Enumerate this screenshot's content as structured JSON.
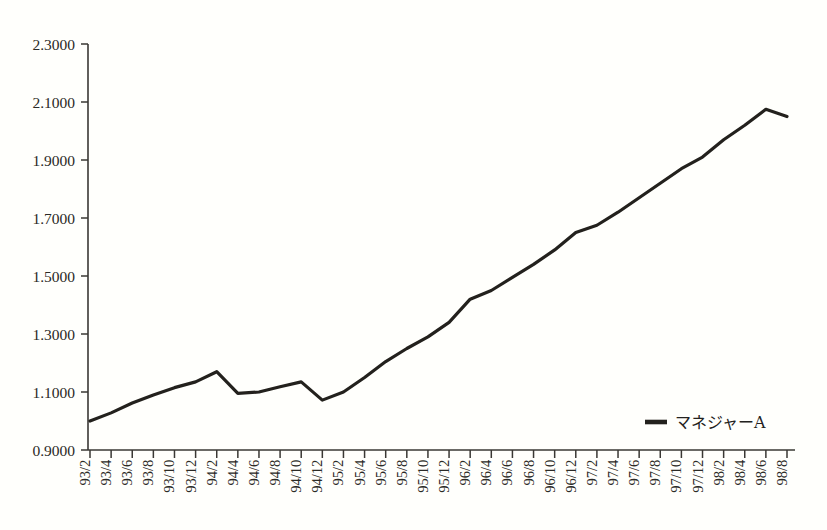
{
  "chart_data": {
    "type": "line",
    "title": "",
    "xlabel": "",
    "ylabel": "",
    "ylim": [
      0.9,
      2.3
    ],
    "ytick_step": 0.2,
    "grid": false,
    "legend_position": "bottom-right",
    "line_color": "#23211d",
    "background_color": "#fffffc",
    "axis_color": "#3a3834",
    "ytick_labels": [
      "0.9000",
      "1.1000",
      "1.3000",
      "1.5000",
      "1.7000",
      "1.9000",
      "2.1000",
      "2.3000"
    ],
    "ytick_values": [
      0.9,
      1.1,
      1.3,
      1.5,
      1.7,
      1.9,
      2.1,
      2.3
    ],
    "categories": [
      "93/2",
      "93/4",
      "93/6",
      "93/8",
      "93/10",
      "93/12",
      "94/2",
      "94/4",
      "94/6",
      "94/8",
      "94/10",
      "94/12",
      "95/2",
      "95/4",
      "95/6",
      "95/8",
      "95/10",
      "95/12",
      "96/2",
      "96/4",
      "96/6",
      "96/8",
      "96/10",
      "96/12",
      "97/2",
      "97/4",
      "97/6",
      "97/8",
      "97/10",
      "97/12",
      "98/2",
      "98/4",
      "98/6",
      "98/8"
    ],
    "series": [
      {
        "name": "マネジャーA",
        "values": [
          1.0,
          1.028,
          1.062,
          1.09,
          1.115,
          1.135,
          1.17,
          1.095,
          1.1,
          1.118,
          1.135,
          1.072,
          1.1,
          1.15,
          1.205,
          1.25,
          1.29,
          1.34,
          1.42,
          1.45,
          1.495,
          1.54,
          1.59,
          1.65,
          1.675,
          1.72,
          1.77,
          1.82,
          1.87,
          1.91,
          1.97,
          2.02,
          2.075,
          2.05
        ]
      }
    ]
  },
  "legend": {
    "entries": [
      {
        "label": "マネジャーA",
        "color": "#23211d"
      }
    ]
  }
}
